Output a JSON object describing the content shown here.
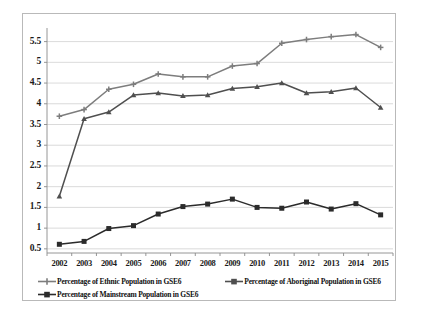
{
  "chart_data": {
    "type": "line",
    "title": "",
    "xlabel": "",
    "ylabel": "",
    "categories": [
      "2002",
      "2003",
      "2004",
      "2005",
      "2006",
      "2007",
      "2008",
      "2009",
      "2010",
      "2011",
      "2012",
      "2013",
      "2014",
      "2015"
    ],
    "ylim": [
      0.4,
      5.78
    ],
    "yticks": [
      "0.5",
      "1",
      "1.5",
      "2",
      "2.5",
      "3",
      "3.5",
      "4",
      "4.5",
      "5",
      "5.5"
    ],
    "ytick_values": [
      0.5,
      1,
      1.5,
      2,
      2.5,
      3,
      3.5,
      4,
      4.5,
      5,
      5.5
    ],
    "grid": true,
    "grid_axis": "y",
    "legend_position": "bottom",
    "series": [
      {
        "name": "Percentage of Ethnic Population in GSE6",
        "color": "#7d7d7d",
        "marker": "cross",
        "values": [
          3.7,
          3.86,
          4.35,
          4.47,
          4.72,
          4.65,
          4.65,
          4.91,
          4.97,
          5.46,
          5.55,
          5.62,
          5.67,
          5.36
        ]
      },
      {
        "name": "Percentage of Aboriginal Population in GSE6",
        "color": "#4f4f4f",
        "marker": "triangle",
        "values": [
          1.77,
          3.64,
          3.8,
          4.21,
          4.26,
          4.19,
          4.21,
          4.37,
          4.41,
          4.5,
          4.26,
          4.29,
          4.38,
          3.91
        ]
      },
      {
        "name": "Percentage of Mainstream Population in GSE6",
        "color": "#2b2b2b",
        "marker": "square",
        "values": [
          0.61,
          0.68,
          0.99,
          1.06,
          1.34,
          1.52,
          1.58,
          1.7,
          1.5,
          1.48,
          1.63,
          1.46,
          1.59,
          1.32
        ]
      }
    ]
  },
  "legend": {
    "items": [
      {
        "label": "Percentage of Ethnic Population in GSE6"
      },
      {
        "label": "Percentage of Aboriginal Population in GSE6"
      },
      {
        "label": "Percentage of Mainstream Population in GSE6"
      }
    ]
  }
}
